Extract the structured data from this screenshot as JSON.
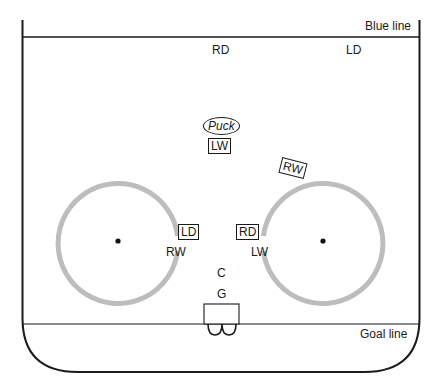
{
  "diagram": {
    "type": "hockey-rink-offensive-zone",
    "lines": {
      "blue_line": "Blue line",
      "goal_line": "Goal line"
    },
    "players": {
      "top_rd": "RD",
      "top_ld": "LD",
      "lw_center": "LW",
      "rw_tilted": "RW",
      "ld_boxed": "LD",
      "rd_boxed": "RD",
      "rw_left": "RW",
      "lw_right": "LW",
      "c": "C",
      "g": "G"
    },
    "puck": "Puck",
    "faceoff_circles": [
      {
        "name": "left",
        "cx": 118,
        "cy": 241,
        "r": 60
      },
      {
        "name": "right",
        "cx": 323,
        "cy": 241,
        "r": 60
      }
    ],
    "colors": {
      "line": "#1a1a1a",
      "circle": "#bdbdbd",
      "background": "#ffffff"
    }
  }
}
